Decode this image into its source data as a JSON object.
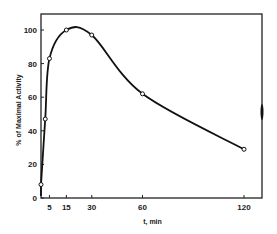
{
  "chart_data": {
    "type": "line",
    "title": "",
    "xlabel": "t, min",
    "ylabel": "% of Maximal Activity",
    "x": [
      0,
      2.5,
      5,
      15,
      30,
      60,
      120
    ],
    "series": [
      {
        "name": "Activity",
        "values": [
          8,
          47,
          83,
          100,
          97,
          62,
          29
        ]
      }
    ],
    "xticks": [
      "5",
      "15",
      "30",
      "60",
      "120"
    ],
    "yticks": [
      "0",
      "20",
      "40",
      "60",
      "80",
      "100"
    ],
    "xlim": [
      0,
      130
    ],
    "ylim": [
      0,
      110
    ],
    "grid": false,
    "legend": "none"
  }
}
